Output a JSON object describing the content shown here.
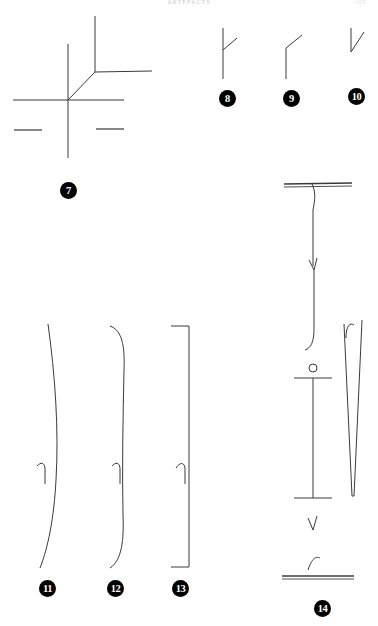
{
  "page": {
    "width": 378,
    "height": 626,
    "background": "#ffffff",
    "ink_color": "#3a3a3a",
    "badge_color": "#000000",
    "badge_text_color": "#ffffff"
  },
  "header": {
    "title": "ARTEFACTS",
    "folio": "105"
  },
  "figures": [
    {
      "id": "figure-7",
      "label": "7",
      "label_x": 60,
      "label_y": 182,
      "description": "cross of intersecting long lines with diagonal branch and two short flanking dashes"
    },
    {
      "id": "figure-8",
      "label": "8",
      "label_x": 219,
      "label_y": 90,
      "description": "vertical stroke with short diagonal branch rising to upper right"
    },
    {
      "id": "figure-9",
      "label": "9",
      "label_x": 283,
      "label_y": 90,
      "description": "vertical stroke bending into diagonal at its top"
    },
    {
      "id": "figure-10",
      "label": "10",
      "label_x": 348,
      "label_y": 88,
      "description": "short vertical stroke with diagonal descending to the right"
    },
    {
      "id": "figure-11",
      "label": "11",
      "label_x": 39,
      "label_y": 580,
      "description": "long slender vertical curve with small hooked notch at mid height"
    },
    {
      "id": "figure-12",
      "label": "12",
      "label_x": 107,
      "label_y": 580,
      "description": "long vertical curve with incurved ends and hooked notch at mid height"
    },
    {
      "id": "figure-13",
      "label": "13",
      "label_x": 172,
      "label_y": 580,
      "description": "bracket shaped profile with squared ends and hooked notch at mid height"
    },
    {
      "id": "figure-14",
      "label": "14",
      "label_x": 314,
      "label_y": 600,
      "description": "composite column with horizontal bar top, long stem with notches, small circle over T bar, narrow tapering wedge and base bar"
    }
  ]
}
